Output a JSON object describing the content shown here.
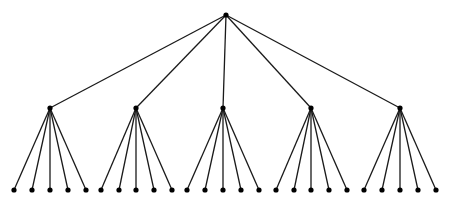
{
  "diagram": {
    "type": "tree",
    "levels": 3,
    "branching_factor": 5,
    "colors": {
      "edge": "#1a1a1a",
      "node": "#000000",
      "background": "#ffffff"
    },
    "root": {
      "x": 226,
      "y": 15
    },
    "middle": [
      {
        "x": 50,
        "y": 108,
        "leaves": [
          14,
          32,
          50,
          68,
          86
        ]
      },
      {
        "x": 136,
        "y": 108,
        "leaves": [
          101,
          119,
          136,
          154,
          172
        ]
      },
      {
        "x": 223,
        "y": 108,
        "leaves": [
          187,
          205,
          223,
          241,
          259
        ]
      },
      {
        "x": 311,
        "y": 108,
        "leaves": [
          276,
          294,
          311,
          329,
          347
        ]
      },
      {
        "x": 400,
        "y": 108,
        "leaves": [
          364,
          382,
          400,
          418,
          436
        ]
      }
    ],
    "leaf_y": 190
  }
}
